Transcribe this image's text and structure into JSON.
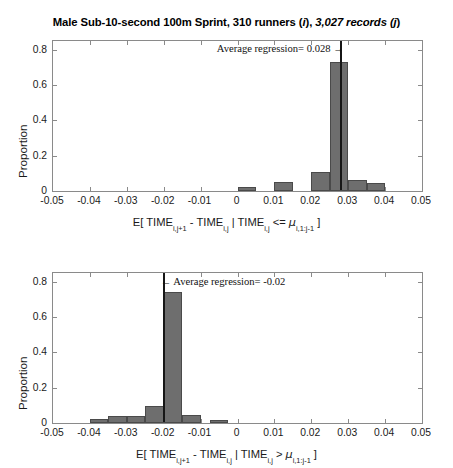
{
  "figure": {
    "title_main": "Male Sub-10-second 100m Sprint, 310 runners (",
    "title_i": "i",
    "title_mid": "), ",
    "title_j_text": "3,027 records (j",
    "title_end": ")",
    "title_full": "Male Sub-10-second 100m Sprint, 310 runners (i), 3,027 records (j)",
    "background_color": "#ffffff",
    "bar_fill_color": "#6e6e6e",
    "bar_edge_color": "#4a4a4a",
    "axis_color": "#8a8a8a",
    "mean_line_color": "#161616"
  },
  "chart_data": [
    {
      "type": "bar",
      "id": "top-histogram",
      "title": "Male Sub-10-second 100m Sprint, 310 runners (i), 3,027 records (j)",
      "xlabel_parts": {
        "p1": "E[ TIME",
        "s1": "i,j+1",
        "p2": " - TIME",
        "s2": "i,j",
        "p3": " | TIME",
        "s3": "i,j",
        "p4": " <= ",
        "mu": "μ",
        "s4": "i,1:j-1",
        "p5": " ]"
      },
      "xlabel": "E[ TIME_i,j+1 - TIME_i,j | TIME_i,j <= μ_i,1:j-1 ]",
      "ylabel": "Proportion",
      "xlim": [
        -0.05,
        0.05
      ],
      "ylim": [
        0,
        0.85
      ],
      "xticks": [
        -0.05,
        -0.04,
        -0.03,
        -0.02,
        -0.01,
        0,
        0.01,
        0.02,
        0.03,
        0.04,
        0.05
      ],
      "xticklabels": [
        "-0.05",
        "-0.04",
        "-0.03",
        "-0.02",
        "-0.01",
        "0",
        "0.01",
        "0.02",
        "0.03",
        "0.04",
        "0.05"
      ],
      "yticks": [
        0,
        0.2,
        0.4,
        0.6,
        0.8
      ],
      "yticklabels": [
        "0",
        "0.2",
        "0.4",
        "0.6",
        "0.8"
      ],
      "grid": false,
      "bin_width": 0.005,
      "bars": [
        {
          "center": 0.0025,
          "value": 0.021
        },
        {
          "center": 0.0125,
          "value": 0.049
        },
        {
          "center": 0.0225,
          "value": 0.11
        },
        {
          "center": 0.0275,
          "value": 0.73
        },
        {
          "center": 0.0325,
          "value": 0.064
        },
        {
          "center": 0.0375,
          "value": 0.043
        }
      ],
      "annotation": {
        "text": "Average regression= 0.028",
        "arrow": "→",
        "arrow_direction": "right",
        "value": 0.028
      },
      "mean_line_x": 0.028
    },
    {
      "type": "bar",
      "id": "bottom-histogram",
      "xlabel_parts": {
        "p1": "E[ TIME",
        "s1": "i,j+1",
        "p2": " - TIME",
        "s2": "i,j",
        "p3": " | TIME",
        "s3": "i,j",
        "p4": " > ",
        "mu": "μ",
        "s4": "i,1:j-1",
        "p5": " ]"
      },
      "xlabel": "E[ TIME_i,j+1 - TIME_i,j | TIME_i,j > μ_i,1:j-1 ]",
      "ylabel": "Proportion",
      "xlim": [
        -0.05,
        0.05
      ],
      "ylim": [
        0,
        0.85
      ],
      "xticks": [
        -0.05,
        -0.04,
        -0.03,
        -0.02,
        -0.01,
        0,
        0.01,
        0.02,
        0.03,
        0.04,
        0.05
      ],
      "xticklabels": [
        "-0.05",
        "-0.04",
        "-0.03",
        "-0.02",
        "-0.01",
        "0",
        "0.01",
        "0.02",
        "0.03",
        "0.04",
        "0.05"
      ],
      "yticks": [
        0,
        0.2,
        0.4,
        0.6,
        0.8
      ],
      "yticklabels": [
        "0",
        "0.2",
        "0.4",
        "0.6",
        "0.8"
      ],
      "grid": false,
      "bin_width": 0.005,
      "bars": [
        {
          "center": -0.0375,
          "value": 0.022
        },
        {
          "center": -0.0325,
          "value": 0.037
        },
        {
          "center": -0.0275,
          "value": 0.04
        },
        {
          "center": -0.0225,
          "value": 0.096
        },
        {
          "center": -0.0175,
          "value": 0.745
        },
        {
          "center": -0.0125,
          "value": 0.048
        },
        {
          "center": -0.005,
          "value": 0.017
        }
      ],
      "annotation": {
        "text": "Average regression= -0.02",
        "arrow": "←",
        "arrow_direction": "left",
        "value": -0.02
      },
      "mean_line_x": -0.02
    }
  ]
}
